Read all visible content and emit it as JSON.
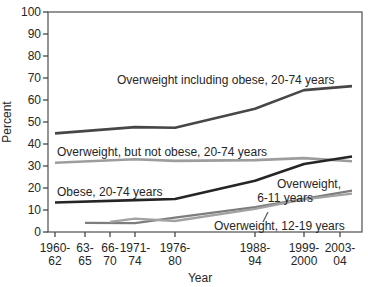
{
  "figure": {
    "background": "#ffffff",
    "border_color": "#4f4f4f",
    "tick_color": "#3a3a3a",
    "text_color": "#262626"
  },
  "chart_data": {
    "type": "line",
    "title": "",
    "xlabel": "Year",
    "ylabel": "Percent",
    "ylim": [
      0,
      100
    ],
    "ytick_step": 10,
    "grid": false,
    "legend_position": "inline-annotations",
    "categories": [
      "1960-62",
      "1963-65",
      "1966-70",
      "1971-74",
      "1976-80",
      "1988-94",
      "1999-2000",
      "2003-04"
    ],
    "xtick_labels_line1": [
      "1960-",
      "63-",
      "66-",
      "1971-",
      "1976-",
      "1988-",
      "1999-",
      "2003-"
    ],
    "xtick_labels_line2": [
      "62",
      "65",
      "70",
      "74",
      "80",
      "94",
      "2000",
      "04"
    ],
    "ytick_labels": [
      "0",
      "10",
      "20",
      "30",
      "40",
      "50",
      "60",
      "70",
      "80",
      "90",
      "100"
    ],
    "series": [
      {
        "name": "Overweight including obese, 20-74 years",
        "color": "#474747",
        "width": 2.6,
        "values": [
          44.8,
          null,
          null,
          47.7,
          47.4,
          56.0,
          64.5,
          66.3
        ]
      },
      {
        "name": "Overweight, but not obese, 20-74 years",
        "color": "#9d9d9d",
        "width": 2.6,
        "values": [
          31.5,
          null,
          null,
          33.1,
          32.3,
          32.7,
          33.6,
          32.2
        ]
      },
      {
        "name": "Obese, 20-74 years",
        "color": "#252525",
        "width": 2.6,
        "values": [
          13.4,
          null,
          null,
          14.5,
          15.0,
          23.3,
          30.9,
          34.3
        ]
      },
      {
        "name": "Overweight, 6-11 years",
        "color": "#7d7d7d",
        "width": 2.3,
        "values": [
          null,
          4.2,
          null,
          4.0,
          6.5,
          11.3,
          15.1,
          18.8
        ]
      },
      {
        "name": "Overweight, 12-19 years",
        "color": "#a2a2a2",
        "width": 2.3,
        "values": [
          null,
          null,
          4.6,
          6.1,
          5.0,
          10.5,
          14.8,
          17.4
        ]
      }
    ],
    "annotations": [
      {
        "text": "Overweight including obese, 20-74 years",
        "x": 117,
        "y": 84,
        "align": "start"
      },
      {
        "text": "Overweight, but not obese, 20-74 years",
        "x": 57,
        "y": 156,
        "align": "start"
      },
      {
        "text": "Obese, 20-74 years",
        "x": 57,
        "y": 196,
        "align": "start"
      },
      {
        "text": "Overweight,",
        "x": 341,
        "y": 188,
        "align": "end"
      },
      {
        "text": "6-11 years",
        "x": 313,
        "y": 202,
        "align": "end"
      },
      {
        "text": "Overweight, 12-19 years",
        "x": 214,
        "y": 230,
        "align": "start",
        "leader": {
          "x1": 263,
          "y1": 222,
          "x2": 268,
          "y2": 212
        }
      }
    ],
    "pixel_layout": {
      "plot_left": 48,
      "plot_top": 12,
      "plot_right": 362,
      "plot_bottom": 232,
      "point_xs": [
        55,
        85,
        110,
        135,
        175,
        255,
        304,
        352
      ],
      "tick_xs": [
        55,
        85,
        110,
        135,
        175,
        255,
        304,
        340
      ],
      "xtick_row1_y": 252,
      "xtick_row2_y": 265,
      "ylabel_cx": 11,
      "ylabel_cy": 122,
      "xlabel_cx": 200,
      "xlabel_cy": 282
    }
  }
}
